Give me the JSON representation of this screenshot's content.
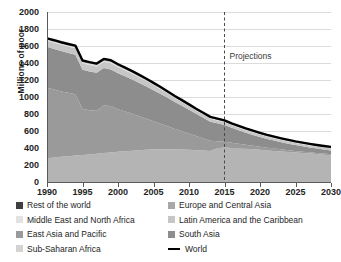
{
  "chart_data": {
    "type": "area",
    "title": "",
    "xlabel": "",
    "ylabel": "Millions of poor",
    "xlim": [
      1990,
      2030
    ],
    "ylim": [
      0,
      2000
    ],
    "ytick_step": 200,
    "grid": true,
    "stacked": true,
    "legend_position": "bottom",
    "x": [
      1990,
      1991,
      1992,
      1993,
      1994,
      1995,
      1996,
      1997,
      1998,
      1999,
      2000,
      2001,
      2002,
      2003,
      2004,
      2005,
      2006,
      2007,
      2008,
      2009,
      2010,
      2011,
      2012,
      2013,
      2014,
      2015,
      2016,
      2017,
      2018,
      2019,
      2020,
      2021,
      2022,
      2023,
      2024,
      2025,
      2026,
      2027,
      2028,
      2029,
      2030
    ],
    "xticks": [
      "1990",
      "1995",
      "2000",
      "2005",
      "2010",
      "2015",
      "2020",
      "2025",
      "2030"
    ],
    "xtick_values": [
      1990,
      1995,
      2000,
      2005,
      2010,
      2015,
      2020,
      2025,
      2030
    ],
    "yticks": [
      "0",
      "200",
      "400",
      "600",
      "800",
      "1000",
      "1200",
      "1400",
      "1600",
      "1800",
      "2000"
    ],
    "ytick_values": [
      0,
      200,
      400,
      600,
      800,
      1000,
      1200,
      1400,
      1600,
      1800,
      2000
    ],
    "annotations": [
      {
        "label": "Projections",
        "x": 2015,
        "y": 1480,
        "type": "divider-label",
        "line": "dashed-vertical"
      }
    ],
    "series": [
      {
        "name": "Sub-Saharan Africa",
        "color": "#b4b4b4",
        "order": 1,
        "values": [
          280,
          288,
          296,
          304,
          312,
          318,
          325,
          332,
          340,
          348,
          356,
          362,
          368,
          374,
          380,
          384,
          386,
          386,
          385,
          383,
          380,
          375,
          370,
          364,
          398,
          405,
          400,
          395,
          390,
          384,
          378,
          372,
          366,
          360,
          353,
          346,
          340,
          334,
          328,
          322,
          316
        ]
      },
      {
        "name": "East Asia and Pacific",
        "color": "#9a9a9a",
        "order": 2,
        "values": [
          830,
          800,
          770,
          745,
          720,
          540,
          520,
          505,
          560,
          545,
          500,
          468,
          435,
          400,
          365,
          330,
          300,
          270,
          240,
          215,
          190,
          165,
          142,
          120,
          82,
          70,
          62,
          55,
          48,
          42,
          37,
          32,
          28,
          25,
          22,
          19,
          17,
          15,
          13,
          12,
          11
        ]
      },
      {
        "name": "South Asia",
        "color": "#8d8d8d",
        "order": 3,
        "values": [
          480,
          478,
          474,
          470,
          466,
          462,
          455,
          448,
          440,
          432,
          424,
          415,
          404,
          392,
          380,
          366,
          350,
          334,
          316,
          298,
          280,
          262,
          244,
          226,
          210,
          196,
          176,
          158,
          142,
          128,
          115,
          103,
          93,
          84,
          76,
          69,
          63,
          58,
          53,
          49,
          45
        ]
      },
      {
        "name": "Latin America and the Caribbean",
        "color": "#c6c6c6",
        "order": 4,
        "values": [
          72,
          73,
          74,
          74,
          75,
          76,
          76,
          75,
          74,
          73,
          72,
          70,
          68,
          66,
          63,
          60,
          56,
          52,
          48,
          45,
          42,
          39,
          37,
          35,
          34,
          33,
          32,
          31,
          30,
          29,
          28,
          27,
          26,
          25,
          25,
          24,
          24,
          23,
          23,
          22,
          22
        ]
      },
      {
        "name": "Middle East and North Africa",
        "color": "#dedede",
        "order": 5,
        "values": [
          14,
          14,
          14,
          14,
          14,
          14,
          14,
          13,
          13,
          13,
          13,
          12,
          12,
          12,
          11,
          11,
          11,
          10,
          10,
          10,
          9,
          9,
          9,
          9,
          9,
          9,
          9,
          9,
          9,
          9,
          8,
          8,
          8,
          8,
          8,
          8,
          8,
          8,
          8,
          8,
          8
        ]
      },
      {
        "name": "Europe and Central Asia",
        "color": "#a8a8a8",
        "order": 6,
        "values": [
          9,
          10,
          11,
          12,
          13,
          14,
          15,
          15,
          16,
          16,
          15,
          14,
          13,
          12,
          11,
          10,
          9,
          8,
          8,
          7,
          7,
          7,
          7,
          7,
          7,
          7,
          7,
          7,
          7,
          7,
          7,
          7,
          7,
          7,
          7,
          7,
          6,
          6,
          6,
          6,
          6
        ]
      },
      {
        "name": "Rest of the world",
        "color": "#3f3f3f",
        "order": 7,
        "values": [
          5,
          5,
          5,
          5,
          5,
          5,
          5,
          5,
          5,
          5,
          5,
          5,
          5,
          5,
          5,
          5,
          5,
          5,
          5,
          5,
          5,
          5,
          5,
          5,
          5,
          5,
          5,
          5,
          5,
          5,
          5,
          5,
          5,
          5,
          5,
          5,
          5,
          5,
          5,
          5,
          5
        ]
      }
    ],
    "world_line": {
      "name": "World",
      "color": "#000000",
      "values": [
        1890,
        1868,
        1844,
        1824,
        1805,
        1429,
        1410,
        1423,
        1448,
        1432,
        1385,
        1346,
        1305,
        1261,
        1215,
        1166,
        1117,
        1065,
        1012,
        963,
        913,
        862,
        812,
        766,
        745,
        725,
        691,
        660,
        631,
        604,
        578,
        554,
        533,
        514,
        496,
        478,
        463,
        449,
        436,
        424,
        413
      ]
    },
    "world_line_display": {
      "note": "Drawn as the top of the stacked bands",
      "start_value": 1890,
      "value_1995": 1690,
      "value_1999": 1720,
      "value_2005": 1500,
      "value_2010": 1240,
      "value_2013": 800,
      "value_2015": 725,
      "value_2020": 600,
      "value_2025": 520,
      "value_2030": 485
    }
  },
  "legend": {
    "left_column": [
      {
        "label": "Rest of the world",
        "swatch": "#3f3f3f",
        "type": "box"
      },
      {
        "label": "Middle East and North Africa",
        "swatch": "#e2e2e2",
        "type": "box"
      },
      {
        "label": "East Asia and Pacific",
        "swatch": "#9a9a9a",
        "type": "box"
      },
      {
        "label": "Sub-Saharan Africa",
        "swatch": "#d3d3d3",
        "type": "box"
      }
    ],
    "right_column": [
      {
        "label": "Europe and Central Asia",
        "swatch": "#a8a8a8",
        "type": "box"
      },
      {
        "label": "Latin America and the Caribbean",
        "swatch": "#c6c6c6",
        "type": "box"
      },
      {
        "label": "South Asia",
        "swatch": "#8d8d8d",
        "type": "box"
      },
      {
        "label": "World",
        "swatch": "#000000",
        "type": "line"
      }
    ]
  },
  "axis": {
    "ylabel": "Millions of poor",
    "projection_label": "Projections"
  }
}
